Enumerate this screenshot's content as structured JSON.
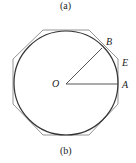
{
  "captions": {
    "top": "(a)",
    "bottom": "(b)"
  },
  "points": {
    "center": "O",
    "a": "A",
    "b": "B",
    "e": "E"
  },
  "figure": {
    "type": "circle-with-circumscribed-octagon",
    "circle_color": "#333333",
    "octagon_color": "#888888",
    "radius_color": "#444444"
  }
}
